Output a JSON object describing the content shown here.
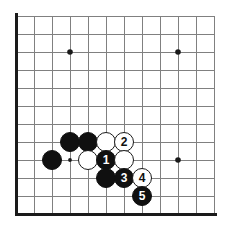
{
  "figure": {
    "type": "go-board-diagram",
    "width": 241,
    "height": 237,
    "background_color": "#ffffff"
  },
  "board": {
    "line_color": "#808080",
    "edge_color": "#1a1a1a",
    "origin_x": 16,
    "origin_y": 16,
    "spacing": 18,
    "columns": 12,
    "rows": 12,
    "edge_lines": [
      "left",
      "bottom"
    ],
    "star_points": [
      {
        "x": 70,
        "y": 52,
        "size": "large"
      },
      {
        "x": 178,
        "y": 52,
        "size": "large"
      },
      {
        "x": 70,
        "y": 160,
        "size": "small"
      },
      {
        "x": 178,
        "y": 160,
        "size": "large"
      }
    ]
  },
  "stones": [
    {
      "color": "black",
      "label": "",
      "x": 70,
      "y": 142
    },
    {
      "color": "black",
      "label": "",
      "x": 88,
      "y": 142
    },
    {
      "color": "white",
      "label": "",
      "x": 106,
      "y": 142
    },
    {
      "color": "white",
      "label": "2",
      "x": 124,
      "y": 142
    },
    {
      "color": "black",
      "label": "",
      "x": 52,
      "y": 160
    },
    {
      "color": "white",
      "label": "",
      "x": 88,
      "y": 160
    },
    {
      "color": "black",
      "label": "1",
      "x": 106,
      "y": 160
    },
    {
      "color": "white",
      "label": "",
      "x": 124,
      "y": 160
    },
    {
      "color": "black",
      "label": "",
      "x": 106,
      "y": 178
    },
    {
      "color": "black",
      "label": "3",
      "x": 124,
      "y": 178
    },
    {
      "color": "white",
      "label": "4",
      "x": 142,
      "y": 178
    },
    {
      "color": "black",
      "label": "5",
      "x": 142,
      "y": 196
    }
  ],
  "stone_style": {
    "radius": 10,
    "black_fill": "#101010",
    "white_fill": "#ffffff",
    "white_outline": "#1a1a1a",
    "black_label_color": "#ffffff",
    "white_label_color": "#101010"
  },
  "move_sequence": [
    {
      "number": "1",
      "color": "black"
    },
    {
      "number": "2",
      "color": "white"
    },
    {
      "number": "3",
      "color": "black"
    },
    {
      "number": "4",
      "color": "white"
    },
    {
      "number": "5",
      "color": "black"
    }
  ]
}
